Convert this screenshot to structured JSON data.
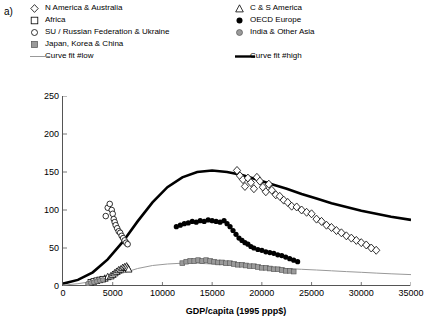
{
  "panel": {
    "label": "a)"
  },
  "legend": {
    "rows": [
      [
        {
          "marker": "open-diamond",
          "label": "N America & Australia"
        },
        {
          "marker": "open-triangle",
          "label": "C & S America"
        }
      ],
      [
        {
          "marker": "open-square",
          "label": "Africa"
        },
        {
          "marker": "filled-circle",
          "label": "OECD Europe"
        }
      ],
      [
        {
          "marker": "open-circle",
          "label": "SU / Russian Federation & Ukraine"
        },
        {
          "marker": "grey-circle",
          "label": "India & Other Asia"
        }
      ],
      [
        {
          "marker": "grey-square",
          "label": "Japan, Korea & China"
        },
        {
          "marker": "none",
          "label": ""
        }
      ],
      [
        {
          "marker": "thin-line",
          "label": "Curve fit #low"
        },
        {
          "marker": "thick-line",
          "label": "Curve fit #high"
        }
      ]
    ]
  },
  "chart_data": {
    "type": "scatter",
    "title": "",
    "xlabel": "GDP/capita (1995 ppp$)",
    "ylabel": "emission intensity (kg SO2/yr/cap)",
    "xlim": [
      0,
      35000
    ],
    "ylim": [
      0,
      250
    ],
    "xticks": [
      0,
      5000,
      10000,
      15000,
      20000,
      25000,
      30000,
      35000
    ],
    "yticks": [
      0,
      50,
      100,
      150,
      200,
      250
    ],
    "grid": false,
    "legend_position": "top",
    "colors": {
      "curve_high": "#000000",
      "curve_low": "#999999",
      "grey_marker": "#9a9a9a",
      "axis": "#555555"
    },
    "series": [
      {
        "name": "N America & Australia",
        "marker": "open-diamond",
        "points": [
          [
            17500,
            152
          ],
          [
            17800,
            145
          ],
          [
            18100,
            140
          ],
          [
            18300,
            131
          ],
          [
            18600,
            142
          ],
          [
            18900,
            136
          ],
          [
            19200,
            128
          ],
          [
            19500,
            143
          ],
          [
            19800,
            138
          ],
          [
            20100,
            130
          ],
          [
            20400,
            124
          ],
          [
            20700,
            134
          ],
          [
            21000,
            126
          ],
          [
            21400,
            120
          ],
          [
            21800,
            118
          ],
          [
            22200,
            113
          ],
          [
            22600,
            110
          ],
          [
            23000,
            105
          ],
          [
            23500,
            104
          ],
          [
            24000,
            100
          ],
          [
            24500,
            97
          ],
          [
            25000,
            95
          ],
          [
            25500,
            88
          ],
          [
            26000,
            85
          ],
          [
            26500,
            80
          ],
          [
            27000,
            77
          ],
          [
            27500,
            73
          ],
          [
            28000,
            70
          ],
          [
            28500,
            66
          ],
          [
            29000,
            63
          ],
          [
            29500,
            60
          ],
          [
            30000,
            57
          ],
          [
            30500,
            54
          ],
          [
            31000,
            50
          ],
          [
            31500,
            47
          ]
        ]
      },
      {
        "name": "C & S America",
        "marker": "open-triangle",
        "points": [
          [
            4200,
            10
          ],
          [
            4500,
            12
          ],
          [
            4800,
            13
          ],
          [
            5000,
            15
          ],
          [
            5200,
            17
          ],
          [
            5400,
            19
          ],
          [
            5600,
            21
          ],
          [
            5800,
            22
          ],
          [
            6000,
            24
          ],
          [
            6200,
            25
          ],
          [
            6400,
            26
          ],
          [
            6500,
            24
          ],
          [
            6600,
            22
          ]
        ]
      },
      {
        "name": "Africa",
        "marker": "open-square",
        "points": [
          [
            2800,
            5
          ],
          [
            3100,
            6
          ],
          [
            3400,
            7
          ],
          [
            3700,
            8
          ],
          [
            4000,
            9
          ]
        ]
      },
      {
        "name": "OECD Europe",
        "marker": "filled-circle",
        "points": [
          [
            11400,
            78
          ],
          [
            11800,
            80
          ],
          [
            12200,
            82
          ],
          [
            12600,
            83
          ],
          [
            13000,
            85
          ],
          [
            13400,
            84
          ],
          [
            13800,
            86
          ],
          [
            14200,
            85
          ],
          [
            14600,
            87
          ],
          [
            15000,
            86
          ],
          [
            15400,
            85
          ],
          [
            15800,
            84
          ],
          [
            16200,
            86
          ],
          [
            16500,
            82
          ],
          [
            16800,
            78
          ],
          [
            17100,
            73
          ],
          [
            17400,
            68
          ],
          [
            17700,
            63
          ],
          [
            18000,
            60
          ],
          [
            18300,
            57
          ],
          [
            18600,
            55
          ],
          [
            18900,
            52
          ],
          [
            19200,
            50
          ],
          [
            19600,
            48
          ],
          [
            20000,
            47
          ],
          [
            20400,
            45
          ],
          [
            20800,
            44
          ],
          [
            21200,
            43
          ],
          [
            21600,
            41
          ],
          [
            22000,
            40
          ],
          [
            22400,
            38
          ],
          [
            22800,
            36
          ],
          [
            23200,
            34
          ],
          [
            23600,
            32
          ]
        ]
      },
      {
        "name": "SU / Russian Federation & Ukraine",
        "marker": "open-circle",
        "points": [
          [
            4300,
            92
          ],
          [
            4500,
            103
          ],
          [
            4700,
            108
          ],
          [
            4900,
            100
          ],
          [
            5000,
            95
          ],
          [
            5100,
            88
          ],
          [
            5200,
            84
          ],
          [
            5300,
            80
          ],
          [
            5450,
            76
          ],
          [
            5600,
            72
          ],
          [
            5750,
            70
          ],
          [
            5900,
            66
          ],
          [
            6050,
            63
          ],
          [
            6200,
            60
          ],
          [
            6350,
            57
          ],
          [
            6500,
            55
          ]
        ]
      },
      {
        "name": "India & Other Asia",
        "marker": "grey-circle",
        "points": [
          [
            2500,
            3
          ],
          [
            2800,
            4
          ],
          [
            3100,
            5
          ],
          [
            3400,
            6
          ],
          [
            3700,
            7
          ],
          [
            4000,
            8
          ]
        ]
      },
      {
        "name": "Japan, Korea & China",
        "marker": "grey-square",
        "points": [
          [
            12000,
            30
          ],
          [
            12400,
            32
          ],
          [
            12800,
            33
          ],
          [
            13200,
            33
          ],
          [
            13600,
            34
          ],
          [
            14000,
            33
          ],
          [
            14400,
            34
          ],
          [
            14800,
            33
          ],
          [
            15200,
            32
          ],
          [
            15600,
            31
          ],
          [
            16000,
            31
          ],
          [
            16400,
            30
          ],
          [
            16800,
            30
          ],
          [
            17200,
            29
          ],
          [
            17600,
            28
          ],
          [
            18000,
            28
          ],
          [
            18400,
            27
          ],
          [
            18800,
            26
          ],
          [
            19200,
            26
          ],
          [
            19600,
            25
          ],
          [
            20000,
            24
          ],
          [
            20400,
            24
          ],
          [
            20800,
            23
          ],
          [
            21200,
            22
          ],
          [
            21600,
            22
          ],
          [
            22000,
            21
          ],
          [
            22400,
            20
          ],
          [
            22800,
            20
          ],
          [
            23200,
            19
          ]
        ]
      }
    ],
    "curves": [
      {
        "name": "Curve fit #high",
        "style": "thick-line",
        "points": [
          [
            0,
            3
          ],
          [
            1500,
            8
          ],
          [
            3000,
            18
          ],
          [
            4500,
            35
          ],
          [
            6000,
            58
          ],
          [
            7500,
            85
          ],
          [
            9000,
            110
          ],
          [
            10500,
            130
          ],
          [
            12000,
            143
          ],
          [
            13500,
            150
          ],
          [
            15000,
            152
          ],
          [
            16500,
            150
          ],
          [
            18000,
            146
          ],
          [
            19500,
            140
          ],
          [
            21000,
            134
          ],
          [
            22500,
            128
          ],
          [
            24000,
            121
          ],
          [
            25500,
            115
          ],
          [
            27000,
            109
          ],
          [
            28500,
            104
          ],
          [
            30000,
            99
          ],
          [
            31500,
            95
          ],
          [
            33000,
            91
          ],
          [
            35000,
            87
          ]
        ]
      },
      {
        "name": "Curve fit #low",
        "style": "thin-line",
        "points": [
          [
            0,
            1
          ],
          [
            1500,
            3
          ],
          [
            3000,
            6
          ],
          [
            4500,
            11
          ],
          [
            6000,
            17
          ],
          [
            7500,
            23
          ],
          [
            9000,
            27
          ],
          [
            10500,
            29
          ],
          [
            12000,
            30
          ],
          [
            13500,
            30
          ],
          [
            15000,
            29
          ],
          [
            16500,
            28
          ],
          [
            18000,
            27
          ],
          [
            19500,
            26
          ],
          [
            21000,
            25
          ],
          [
            22500,
            23
          ],
          [
            24000,
            22
          ],
          [
            25500,
            21
          ],
          [
            27000,
            20
          ],
          [
            28500,
            19
          ],
          [
            30000,
            18
          ],
          [
            31500,
            17
          ],
          [
            33000,
            16
          ],
          [
            35000,
            15
          ]
        ]
      }
    ]
  }
}
